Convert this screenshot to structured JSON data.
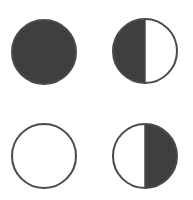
{
  "diagram": {
    "type": "moon-phase-circles",
    "colors": {
      "fill": "#3f3f3f",
      "stroke": "#4a4a4a",
      "background": "#ffffff",
      "empty": "#ffffff"
    },
    "shapes": [
      {
        "id": "full-filled",
        "cx": 44,
        "cy": 52,
        "r": 32,
        "fill": "full"
      },
      {
        "id": "left-half-filled",
        "cx": 145,
        "cy": 51,
        "r": 32,
        "fill": "left"
      },
      {
        "id": "empty",
        "cx": 44,
        "cy": 156,
        "r": 32,
        "fill": "none"
      },
      {
        "id": "right-half-filled",
        "cx": 145,
        "cy": 156,
        "r": 32,
        "fill": "right"
      }
    ]
  }
}
